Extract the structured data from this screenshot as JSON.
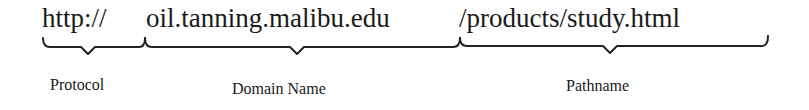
{
  "url": {
    "protocol": "http://",
    "domain": "oil.tanning.malibu.edu",
    "pathname": "/products/study.html"
  },
  "labels": {
    "protocol": "Protocol",
    "domain": "Domain Name",
    "pathname": "Pathname"
  },
  "colors": {
    "text": "#1a1a1a",
    "brace": "#222222",
    "background": "#ffffff"
  }
}
